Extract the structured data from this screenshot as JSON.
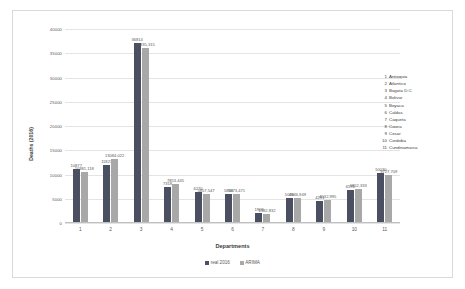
{
  "chart_data": {
    "type": "bar",
    "title": "",
    "xlabel": "Departments",
    "ylabel": "Deaths (2016)",
    "ylim": [
      0,
      40000
    ],
    "yticks": [
      "0",
      "5000",
      "10000",
      "15000",
      "20000",
      "25000",
      "30000",
      "35000",
      "40000"
    ],
    "grid": true,
    "legend_position": "bottom",
    "categories": [
      "1",
      "2",
      "3",
      "4",
      "5",
      "6",
      "7",
      "8",
      "9",
      "10",
      "11"
    ],
    "series": [
      {
        "name": "real 2016",
        "color": "#4a4f61",
        "values": [
          10877,
          11823,
          36814,
          7318,
          6270,
          5833,
          1909,
          5030,
          4291,
          6576,
          10030
        ],
        "labels": [
          "10877",
          "11823",
          "36814",
          "7318",
          "6270",
          "5833",
          "1909",
          "5030",
          "4291",
          "6576",
          "10030"
        ]
      },
      {
        "name": "ARIMA",
        "color": "#a8a8a8",
        "values": [
          10381.118,
          13084.022,
          35835.315,
          7853.445,
          5857.547,
          5673.471,
          1582.832,
          4946.949,
          4532.995,
          6852.333,
          9727.709
        ],
        "labels": [
          "10381,118",
          "13084,022",
          "35835,315",
          "7853,445",
          "5857,547",
          "5673,471",
          "1582,832",
          "4946,949",
          "4532,995",
          "6852,333",
          "9727,709"
        ]
      }
    ],
    "department_key": [
      {
        "num": "1",
        "name": "Antioquia"
      },
      {
        "num": "2",
        "name": "Atlantico"
      },
      {
        "num": "3",
        "name": "Bogota D.C"
      },
      {
        "num": "4",
        "name": "Bolivar"
      },
      {
        "num": "5",
        "name": "Boyaca"
      },
      {
        "num": "6",
        "name": "Caldas"
      },
      {
        "num": "7",
        "name": "Caqueta"
      },
      {
        "num": "8",
        "name": "Cauca"
      },
      {
        "num": "9",
        "name": "Cesar"
      },
      {
        "num": "10",
        "name": "Cordoba"
      },
      {
        "num": "11",
        "name": "Cundinamarca"
      }
    ]
  }
}
